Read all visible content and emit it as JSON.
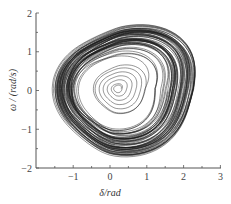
{
  "chart_data": {
    "type": "line",
    "title": "",
    "xlabel": "δ/rad",
    "ylabel": "ω / (rad/s)",
    "xlim": [
      -2,
      3
    ],
    "ylim": [
      -2,
      2
    ],
    "x_ticks": [
      -1,
      0,
      1,
      2,
      3
    ],
    "y_ticks": [
      -2,
      -1,
      0,
      1,
      2
    ],
    "x_tick_labels": [
      "-1",
      "0",
      "1",
      "2",
      "3"
    ],
    "y_tick_labels": [
      "-2",
      "-1",
      "0",
      "1",
      "2"
    ],
    "grid": false,
    "legend": null,
    "series": [
      {
        "name": "phase trajectory",
        "description": "chaotic phase-plane trajectory spiraling outward from center (~0.2, 0.05) to outer envelope",
        "center": [
          0.2,
          0.05
        ],
        "envelope": {
          "delta_min": -1.5,
          "delta_max": 2.5,
          "omega_min": -1.7,
          "omega_max": 1.75
        },
        "color": "#1a1a1a"
      }
    ]
  }
}
